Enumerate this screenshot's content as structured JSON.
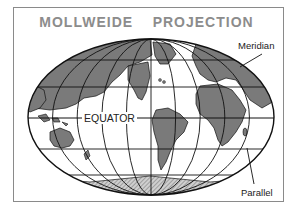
{
  "title": "MOLLWEIDE    PROJECTION",
  "labels": {
    "meridian": "Meridian",
    "equator": "EQUATOR",
    "parallel": "Parallel"
  },
  "colors": {
    "land": "#7a7a7a",
    "ocean": "#ffffff",
    "lines": "#111111",
    "title": "#8c8c8c",
    "frame": "#8a8a8a"
  },
  "projection": {
    "name": "Mollweide",
    "shape": "ellipse",
    "meridians_each_side": 5,
    "parallels_each_hemisphere": 2
  }
}
